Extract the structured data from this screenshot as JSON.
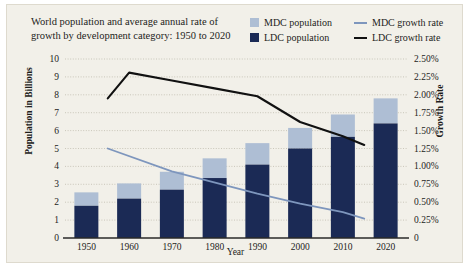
{
  "title": "World population and average annual rate of growth by development category: 1950 to 2020",
  "legend": {
    "mdc_population": "MDC population",
    "ldc_population": "LDC population",
    "mdc_growth": "MDC growth rate",
    "ldc_growth": "LDC growth rate"
  },
  "colors": {
    "mdc_population": "#aebed4",
    "ldc_population": "#1b2a55",
    "mdc_growth": "#7e96bd",
    "ldc_growth": "#111111",
    "background": "#f2f0e9",
    "gridline": "#b9b5a6",
    "axis": "#2a2a28"
  },
  "chart_data": {
    "type": "bar",
    "title": "World population and average annual rate of growth by development category: 1950 to 2020",
    "xlabel": "Year",
    "ylabel": "Population in Billions",
    "y2label": "Growth Rate",
    "grid": true,
    "legend_position": "top-right",
    "categories": [
      "1950",
      "1960",
      "1970",
      "1980",
      "1990",
      "2000",
      "2010",
      "2020"
    ],
    "ylim": [
      0,
      10
    ],
    "yticks": [
      "0",
      "1",
      "2",
      "3",
      "4",
      "5",
      "6",
      "7",
      "8",
      "9",
      "10"
    ],
    "y2lim": [
      0,
      2.5
    ],
    "y2ticks": [
      "0",
      "0.25%",
      "0.50%",
      "0.75%",
      "1.00%",
      "1.25%",
      "1.50%",
      "1.75%",
      "2.00%",
      "2.25%",
      "2.50%"
    ],
    "series": [
      {
        "name": "LDC population",
        "type": "bar",
        "stack": "population",
        "axis": "left",
        "unit": "billions",
        "values": [
          1.8,
          2.2,
          2.7,
          3.35,
          4.1,
          5.0,
          5.65,
          6.4
        ]
      },
      {
        "name": "MDC population",
        "type": "bar",
        "stack": "population",
        "axis": "left",
        "unit": "billions",
        "values": [
          0.75,
          0.85,
          1.0,
          1.1,
          1.2,
          1.15,
          1.25,
          1.4
        ]
      },
      {
        "name": "LDC growth rate",
        "type": "line",
        "axis": "right",
        "unit": "percent",
        "x": [
          "1955",
          "1960",
          "1970",
          "1980",
          "1990",
          "2000",
          "2010",
          "2015"
        ],
        "values": [
          1.95,
          2.31,
          2.2,
          2.09,
          1.98,
          1.62,
          1.42,
          1.3
        ]
      },
      {
        "name": "MDC growth rate",
        "type": "line",
        "axis": "right",
        "unit": "percent",
        "x": [
          "1955",
          "1970",
          "1990",
          "2000",
          "2010",
          "2015"
        ],
        "values": [
          1.25,
          0.93,
          0.62,
          0.48,
          0.36,
          0.27
        ]
      }
    ],
    "totals": [
      2.55,
      3.05,
      3.7,
      4.45,
      5.3,
      6.15,
      6.9,
      7.8
    ]
  }
}
